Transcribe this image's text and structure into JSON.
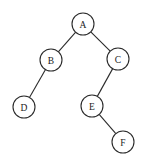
{
  "diagram": {
    "type": "binary-tree",
    "colors": {
      "stroke": "#2a2a2a",
      "fill": "#ffffff",
      "text": "#222222"
    },
    "node_radius": 11,
    "nodes": [
      {
        "id": "A",
        "label": "A",
        "x": 83,
        "y": 24
      },
      {
        "id": "B",
        "label": "B",
        "x": 51,
        "y": 60
      },
      {
        "id": "C",
        "label": "C",
        "x": 118,
        "y": 59
      },
      {
        "id": "D",
        "label": "D",
        "x": 24,
        "y": 107
      },
      {
        "id": "E",
        "label": "E",
        "x": 92,
        "y": 106
      },
      {
        "id": "F",
        "label": "F",
        "x": 123,
        "y": 142
      }
    ],
    "edges": [
      {
        "from": "A",
        "to": "B"
      },
      {
        "from": "A",
        "to": "C"
      },
      {
        "from": "B",
        "to": "D"
      },
      {
        "from": "C",
        "to": "E"
      },
      {
        "from": "E",
        "to": "F"
      }
    ]
  }
}
